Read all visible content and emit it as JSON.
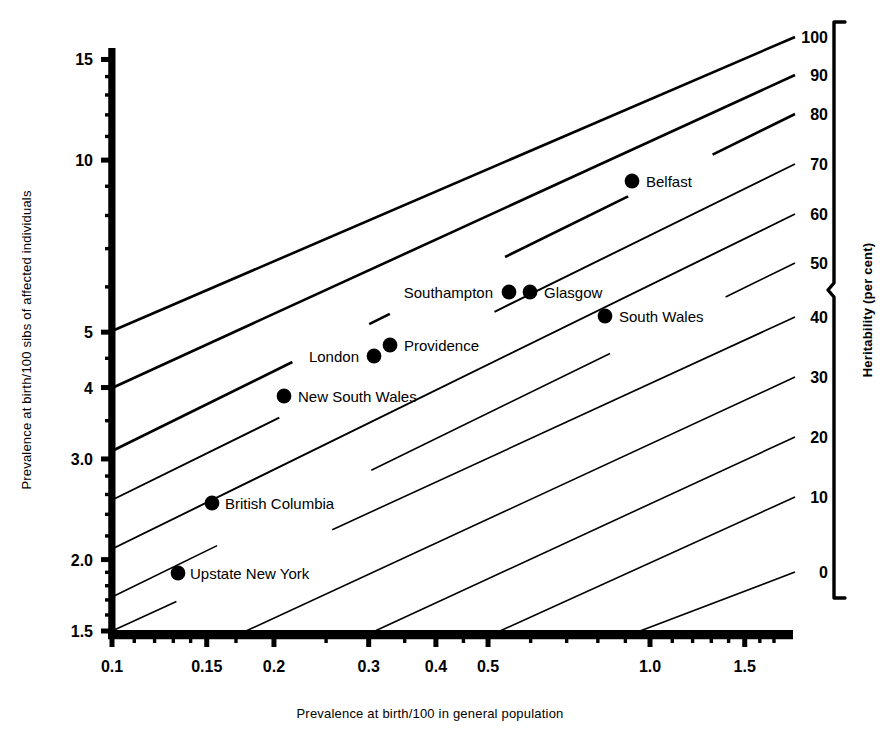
{
  "chart_data": {
    "type": "scatter",
    "title": "",
    "xlabel": "Prevalence at birth/100 in general population",
    "ylabel": "Prevalence at birth/100 sibs of affected individuals",
    "y2label": "Heritability (per cent)",
    "xscale": "log",
    "yscale": "log",
    "xlim": [
      0.1,
      1.72
    ],
    "ylim": [
      1.5,
      15.9
    ],
    "grid": false,
    "legend_position": "none",
    "xticks": [
      {
        "value": 0.1,
        "label": "0.1"
      },
      {
        "value": 0.15,
        "label": "0.15"
      },
      {
        "value": 0.2,
        "label": "0.2"
      },
      {
        "value": 0.3,
        "label": "0.3"
      },
      {
        "value": 0.4,
        "label": "0.4"
      },
      {
        "value": 0.5,
        "label": "0.5"
      },
      {
        "value": 1.0,
        "label": "1.0"
      },
      {
        "value": 1.5,
        "label": "1.5"
      }
    ],
    "yticks": [
      {
        "value": 15,
        "label": "15"
      },
      {
        "value": 10,
        "label": "10"
      },
      {
        "value": 5,
        "label": "5"
      },
      {
        "value": 4,
        "label": "4"
      },
      {
        "value": 3.0,
        "label": "3.0"
      },
      {
        "value": 2.0,
        "label": "2.0"
      },
      {
        "value": 1.5,
        "label": "1.5"
      }
    ],
    "y2ticks": [
      {
        "label": "100",
        "y": 37
      },
      {
        "label": "90",
        "y": 75
      },
      {
        "label": "80",
        "y": 114
      },
      {
        "label": "70",
        "y": 164
      },
      {
        "label": "60",
        "y": 214
      },
      {
        "label": "50",
        "y": 263
      },
      {
        "label": "40",
        "y": 317
      },
      {
        "label": "30",
        "y": 377
      },
      {
        "label": "20",
        "y": 437
      },
      {
        "label": "10",
        "y": 497
      },
      {
        "label": "0",
        "y": 572
      }
    ],
    "heritability_lines": [
      {
        "heritability": 100,
        "x1": 112,
        "y1": 331,
        "x2": 795,
        "y2": 37
      },
      {
        "heritability": 90,
        "x1": 112,
        "y1": 388,
        "x2": 795,
        "y2": 75
      },
      {
        "heritability": 80,
        "x1": 112,
        "y1": 451,
        "x2": 795,
        "y2": 114
      },
      {
        "heritability": 70,
        "x1": 112,
        "y1": 500,
        "x2": 795,
        "y2": 164
      },
      {
        "heritability": 60,
        "x1": 112,
        "y1": 549,
        "x2": 795,
        "y2": 214
      },
      {
        "heritability": 50,
        "x1": 112,
        "y1": 597,
        "x2": 795,
        "y2": 263
      },
      {
        "heritability": 40,
        "x1": 112,
        "y1": 631,
        "x2": 795,
        "y2": 317
      },
      {
        "heritability": 30,
        "x1": 246,
        "y1": 631,
        "x2": 795,
        "y2": 377
      },
      {
        "heritability": 20,
        "x1": 375,
        "y1": 631,
        "x2": 795,
        "y2": 437
      },
      {
        "heritability": 10,
        "x1": 500,
        "y1": 631,
        "x2": 795,
        "y2": 497
      },
      {
        "heritability": 0,
        "x1": 640,
        "y1": 631,
        "x2": 795,
        "y2": 572
      }
    ],
    "points": [
      {
        "name": "Belfast",
        "x": 0.84,
        "y": 8.7,
        "px": 632,
        "py": 181,
        "label_dx": 14,
        "label_anchor": "start"
      },
      {
        "name": "Southampton",
        "x": 0.5,
        "y": 5.7,
        "px": 509,
        "py": 292,
        "label_dx": -16,
        "label_anchor": "end"
      },
      {
        "name": "Glasgow",
        "x": 0.53,
        "y": 5.7,
        "px": 530,
        "py": 292,
        "label_dx": 14,
        "label_anchor": "start"
      },
      {
        "name": "South Wales",
        "x": 0.78,
        "y": 5.1,
        "px": 605,
        "py": 316,
        "label_dx": 14,
        "label_anchor": "start"
      },
      {
        "name": "Providence",
        "x": 0.31,
        "y": 4.6,
        "px": 390,
        "py": 345,
        "label_dx": 14,
        "label_anchor": "start"
      },
      {
        "name": "London",
        "x": 0.295,
        "y": 4.4,
        "px": 374,
        "py": 356,
        "label_dx": -15,
        "label_anchor": "end"
      },
      {
        "name": "New South Wales",
        "x": 0.205,
        "y": 3.8,
        "px": 284,
        "py": 396,
        "label_dx": 14,
        "label_anchor": "start"
      },
      {
        "name": "British Columbia",
        "x": 0.15,
        "y": 2.5,
        "px": 212,
        "py": 503,
        "label_dx": 13,
        "label_anchor": "start"
      },
      {
        "name": "Upstate New York",
        "x": 0.133,
        "y": 1.85,
        "px": 178,
        "py": 573,
        "label_dx": 12,
        "label_anchor": "start"
      }
    ]
  },
  "axes": {
    "x_title": "Prevalence at birth/100 in general population",
    "y_title": "Prevalence at birth/100 sibs of affected individuals",
    "y2_title": "Heritability (per cent)"
  }
}
